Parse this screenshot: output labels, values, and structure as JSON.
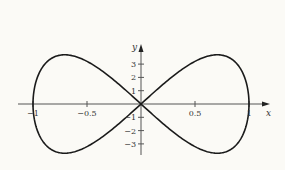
{
  "chart_data": {
    "type": "line",
    "title": "",
    "xlabel": "x",
    "ylabel": "y",
    "xlim": [
      -1.15,
      1.15
    ],
    "ylim": [
      -3.8,
      4.3
    ],
    "grid": false,
    "x_ticks": [
      {
        "value": -1,
        "label": "−1"
      },
      {
        "value": -0.5,
        "label": "−0.5"
      },
      {
        "value": 0.5,
        "label": "0.5"
      },
      {
        "value": 1,
        "label": "1"
      }
    ],
    "y_ticks": [
      {
        "value": 3,
        "label": "3"
      },
      {
        "value": 2,
        "label": "2"
      },
      {
        "value": 1,
        "label": "1"
      },
      {
        "value": -1,
        "label": "−1"
      },
      {
        "value": -2,
        "label": "−2"
      },
      {
        "value": -3,
        "label": "−3"
      }
    ],
    "series": [
      {
        "name": "figure-eight curve",
        "description": "Closed figure-eight (lemniscate-like) curve through origin, crossing x-axis at -1, 0, 1; max |y| ~3.7 at x ~ +/-0.6",
        "color": "#1a1a1a"
      }
    ]
  },
  "colors": {
    "background": "#fbfaf6",
    "curve": "#1a1a1a",
    "axis": "#555555"
  }
}
